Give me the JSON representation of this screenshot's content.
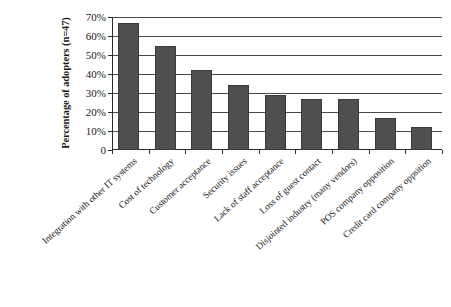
{
  "chart_data": {
    "type": "bar",
    "title": "",
    "xlabel": "",
    "ylabel": "Percentage of adopters (n=47)",
    "ylim": [
      0,
      70
    ],
    "ytick_labels": [
      "0",
      "10%",
      "20%",
      "30%",
      "40%",
      "50%",
      "60%",
      "70%"
    ],
    "ytick_values": [
      0,
      10,
      20,
      30,
      40,
      50,
      60,
      70
    ],
    "grid": true,
    "legend": "none",
    "bar_color": "#4f4f4f",
    "categories": [
      "Integration with other IT systems",
      "Cost of technology",
      "Customer acceptance",
      "Security issues",
      "Lack of staff acceptance",
      "Loss of guest contact",
      "Disjointed industry (many vendors)",
      "POS company opposition",
      "Credit card company oppsition"
    ],
    "values": [
      67,
      55,
      42,
      34,
      29,
      27,
      27,
      17,
      12
    ]
  },
  "axes": {
    "y_title": "Percentage of adopters (n=47)"
  }
}
